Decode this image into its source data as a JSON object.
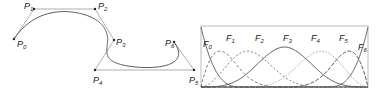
{
  "left_figure": {
    "title": "B-spline curve with control polygon",
    "control_points": [
      {
        "name": "P",
        "index": "0",
        "x": 14,
        "y": 39,
        "lx": 17,
        "ly": 47
      },
      {
        "name": "P",
        "index": "1",
        "x": 34,
        "y": 9,
        "lx": 24,
        "ly": 9
      },
      {
        "name": "P",
        "index": "2",
        "x": 95,
        "y": 9,
        "lx": 98,
        "ly": 9
      },
      {
        "name": "P",
        "index": "3",
        "x": 114,
        "y": 40,
        "lx": 116,
        "ly": 45
      },
      {
        "name": "P",
        "index": "4",
        "x": 95,
        "y": 70,
        "lx": 93,
        "ly": 83
      },
      {
        "name": "P",
        "index": "5",
        "x": 194,
        "y": 70,
        "lx": 189,
        "ly": 83
      },
      {
        "name": "P",
        "index": "6",
        "x": 174,
        "y": 42,
        "lx": 165,
        "ly": 46
      }
    ],
    "colors": {
      "curve": "#555555",
      "polygon": "#777777",
      "point": "#222222"
    }
  },
  "right_figure": {
    "title": "B-spline basis functions",
    "box": {
      "x": 201,
      "y": 26,
      "w": 167,
      "h": 61
    },
    "labels": [
      {
        "name": "F",
        "index": "0",
        "x": 203,
        "y": 47
      },
      {
        "name": "F",
        "index": "1",
        "x": 226,
        "y": 41
      },
      {
        "name": "F",
        "index": "2",
        "x": 255,
        "y": 41
      },
      {
        "name": "F",
        "index": "3",
        "x": 283,
        "y": 41
      },
      {
        "name": "F",
        "index": "4",
        "x": 311,
        "y": 41
      },
      {
        "name": "F",
        "index": "5",
        "x": 339,
        "y": 41
      },
      {
        "name": "F",
        "index": "6",
        "x": 358,
        "y": 50
      }
    ],
    "styles": [
      {
        "stroke": "#555555",
        "dash": ""
      },
      {
        "stroke": "#666666",
        "dash": "3,2"
      },
      {
        "stroke": "#666666",
        "dash": "2,2"
      },
      {
        "stroke": "#444444",
        "dash": ""
      },
      {
        "stroke": "#999999",
        "dash": "1.5,1.5"
      },
      {
        "stroke": "#444444",
        "dash": "4,1.5"
      },
      {
        "stroke": "#555555",
        "dash": ""
      }
    ]
  }
}
